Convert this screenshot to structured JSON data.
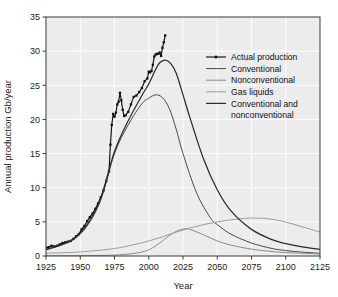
{
  "chart_data": {
    "type": "line",
    "title": "",
    "xlabel": "Year",
    "ylabel": "Annual production Gb/year",
    "xlim": [
      1925,
      2125
    ],
    "ylim": [
      0,
      35
    ],
    "xticks": [
      1925,
      1950,
      1975,
      2000,
      2025,
      2050,
      2075,
      2100,
      2125
    ],
    "yticks": [
      0,
      5,
      10,
      15,
      20,
      25,
      30,
      35
    ],
    "grid": true,
    "legend_position": "upper right",
    "series": [
      {
        "name": "Actual production",
        "style": "line-with-markers",
        "color": "#111111",
        "x": [
          1925,
          1927,
          1929,
          1931,
          1933,
          1935,
          1937,
          1939,
          1941,
          1943,
          1945,
          1947,
          1949,
          1951,
          1953,
          1955,
          1957,
          1959,
          1961,
          1963,
          1965,
          1967,
          1969,
          1971,
          1972,
          1973,
          1974,
          1975,
          1976,
          1977,
          1978,
          1979,
          1980,
          1981,
          1982,
          1983,
          1985,
          1987,
          1989,
          1991,
          1993,
          1995,
          1997,
          1999,
          2000,
          2001,
          2002,
          2003,
          2004,
          2005,
          2006,
          2007,
          2008,
          2009,
          2010,
          2011,
          2012
        ],
        "y": [
          1.2,
          1.3,
          1.5,
          1.4,
          1.5,
          1.7,
          1.9,
          2.0,
          2.1,
          2.2,
          2.5,
          2.9,
          3.2,
          3.9,
          4.4,
          5.1,
          5.7,
          6.2,
          6.9,
          7.7,
          8.6,
          9.6,
          11.0,
          12.4,
          16.3,
          19.2,
          20.8,
          20.4,
          21.0,
          22.2,
          22.6,
          23.9,
          22.8,
          21.4,
          20.5,
          20.6,
          21.1,
          22.2,
          23.3,
          23.5,
          24.0,
          24.6,
          25.6,
          26.0,
          27.0,
          26.9,
          27.1,
          28.0,
          29.2,
          29.5,
          29.6,
          29.6,
          29.8,
          29.3,
          30.5,
          31.3,
          32.3
        ]
      },
      {
        "name": "Conventional",
        "style": "line",
        "color": "#4a4a4a",
        "x": [
          1925,
          1935,
          1945,
          1955,
          1965,
          1975,
          1985,
          1995,
          2000,
          2005,
          2010,
          2015,
          2020,
          2025,
          2035,
          2045,
          2050,
          2060,
          2075,
          2090,
          2100,
          2110,
          2125
        ],
        "y": [
          0.9,
          1.5,
          2.4,
          4.4,
          8.2,
          15.0,
          19.2,
          22.3,
          23.1,
          23.6,
          23.2,
          21.6,
          18.6,
          15.0,
          9.2,
          5.6,
          4.6,
          3.2,
          1.9,
          1.1,
          0.8,
          0.6,
          0.4
        ]
      },
      {
        "name": "Nonconventional",
        "style": "line",
        "color": "#8a8a8a",
        "x": [
          1925,
          1950,
          1970,
          1980,
          1990,
          2000,
          2010,
          2015,
          2020,
          2025,
          2030,
          2040,
          2050,
          2060,
          2075,
          2090,
          2100,
          2125
        ],
        "y": [
          0.02,
          0.05,
          0.1,
          0.2,
          0.4,
          0.9,
          2.2,
          3.0,
          3.6,
          3.95,
          3.9,
          3.1,
          2.2,
          1.6,
          1.0,
          0.65,
          0.5,
          0.3
        ]
      },
      {
        "name": "Gas liquids",
        "style": "line",
        "color": "#9b9b9b",
        "x": [
          1925,
          1950,
          1975,
          1990,
          2000,
          2010,
          2020,
          2030,
          2040,
          2050,
          2060,
          2070,
          2075,
          2085,
          2095,
          2105,
          2115,
          2125
        ],
        "y": [
          0.4,
          0.6,
          1.1,
          1.7,
          2.2,
          2.8,
          3.5,
          4.1,
          4.6,
          5.0,
          5.3,
          5.5,
          5.55,
          5.5,
          5.2,
          4.7,
          4.1,
          3.5
        ]
      },
      {
        "name": "Conventional and nonconventional",
        "style": "line",
        "color": "#2b2b2b",
        "x": [
          1925,
          1935,
          1945,
          1955,
          1965,
          1975,
          1985,
          1995,
          2000,
          2005,
          2008,
          2012,
          2016,
          2020,
          2025,
          2030,
          2040,
          2050,
          2060,
          2075,
          2090,
          2100,
          2110,
          2125
        ],
        "y": [
          0.95,
          1.6,
          2.5,
          4.6,
          8.5,
          15.3,
          19.8,
          23.5,
          25.2,
          27.3,
          28.3,
          28.7,
          28.2,
          26.8,
          23.6,
          20.3,
          14.2,
          9.7,
          6.6,
          3.9,
          2.4,
          1.8,
          1.4,
          0.95
        ]
      }
    ]
  },
  "legend": {
    "items": [
      {
        "label": "Actual production",
        "marker": "line-marker"
      },
      {
        "label": "Conventional",
        "marker": "line"
      },
      {
        "label": "Nonconventional",
        "marker": "line"
      },
      {
        "label": "Gas liquids",
        "marker": "line"
      },
      {
        "label": "Conventional and",
        "marker": "line"
      },
      {
        "label": "nonconventional",
        "marker": "none"
      }
    ]
  },
  "style": {
    "plot_background": "#ececec",
    "grid_color": "#ffffff",
    "axis_color": "#3a3a3a",
    "page_background": "#ffffff"
  }
}
